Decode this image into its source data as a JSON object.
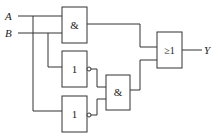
{
  "diagram": {
    "type": "logic-circuit",
    "inputs": [
      {
        "label": "A"
      },
      {
        "label": "B"
      }
    ],
    "output": {
      "label": "Y"
    },
    "gates": [
      {
        "id": "and1",
        "symbol": "&",
        "kind": "AND",
        "inputs": [
          "A",
          "B"
        ]
      },
      {
        "id": "not1",
        "symbol": "1",
        "kind": "NOT",
        "inputs": [
          "B"
        ]
      },
      {
        "id": "not2",
        "symbol": "1",
        "kind": "NOT",
        "inputs": [
          "A"
        ]
      },
      {
        "id": "and2",
        "symbol": "&",
        "kind": "AND",
        "inputs": [
          "not1",
          "not2"
        ]
      },
      {
        "id": "or1",
        "symbol": "≥1",
        "kind": "OR",
        "inputs": [
          "and1",
          "and2"
        ]
      }
    ]
  }
}
